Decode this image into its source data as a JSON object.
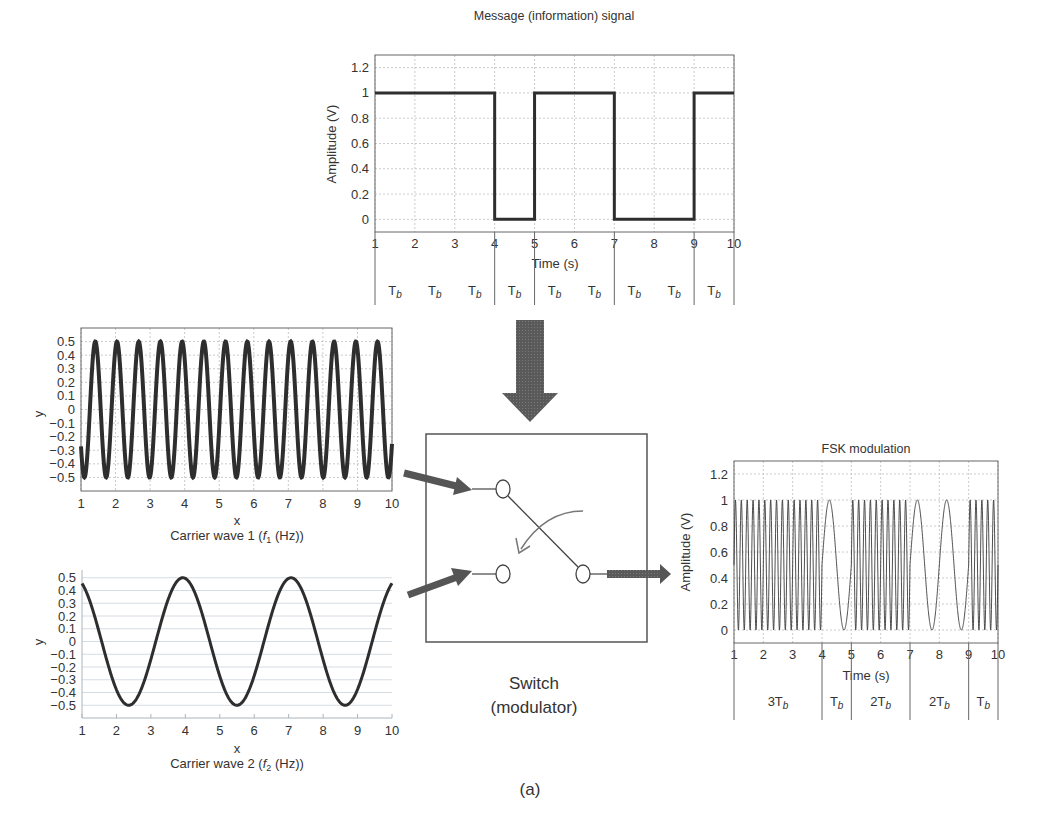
{
  "figure": {
    "caption": "(a)",
    "switch_label_line1": "Switch",
    "switch_label_line2": "(modulator)"
  },
  "chart_data": [
    {
      "id": "message",
      "type": "line",
      "title": "Message (information) signal",
      "xlabel": "Time (s)",
      "ylabel": "Amplitude (V)",
      "xlim": [
        1,
        10
      ],
      "ylim": [
        -0.1,
        1.3
      ],
      "xticks": [
        1,
        2,
        3,
        4,
        5,
        6,
        7,
        8,
        9,
        10
      ],
      "yticks": [
        0,
        0.2,
        0.4,
        0.6,
        0.8,
        1,
        1.2
      ],
      "ytick_labels": [
        "0",
        "0.2",
        "0.4",
        "0.6",
        "0.8",
        "1",
        "1.2"
      ],
      "grid": true,
      "x": [
        1,
        4,
        4,
        5,
        5,
        7,
        7,
        9,
        9,
        10
      ],
      "values": [
        1,
        1,
        0,
        0,
        1,
        1,
        0,
        0,
        1,
        1
      ],
      "bits": [
        1,
        1,
        1,
        0,
        1,
        1,
        0,
        0,
        1
      ],
      "bit_labels": [
        "Tb",
        "Tb",
        "Tb",
        "Tb",
        "Tb",
        "Tb",
        "Tb",
        "Tb",
        "Tb"
      ],
      "bit_dividers": [
        1,
        4,
        5,
        7,
        9,
        10
      ]
    },
    {
      "id": "carrier1",
      "type": "line",
      "title": "Carrier wave 1 (f1 (Hz))",
      "xlabel": "x",
      "ylabel": "y",
      "xlim": [
        1,
        10
      ],
      "ylim": [
        -0.6,
        0.6
      ],
      "xticks": [
        1,
        2,
        3,
        4,
        5,
        6,
        7,
        8,
        9,
        10
      ],
      "yticks": [
        0.5,
        0.4,
        0.3,
        0.2,
        0.1,
        0,
        -0.1,
        -0.2,
        -0.3,
        -0.4,
        -0.5
      ],
      "ytick_labels": [
        "0.5",
        "0.4",
        "0.3",
        "0.2",
        "0.1",
        "0",
        "−0.1",
        "−0.2",
        "−0.3",
        "−0.4",
        "−0.5"
      ],
      "function": "y = 0.5*sin(10x)",
      "amplitude": 0.5,
      "angular_freq": 10,
      "grid": true
    },
    {
      "id": "carrier2",
      "type": "line",
      "title": "Carrier wave 2 (f2 (Hz))",
      "xlabel": "x",
      "ylabel": "y",
      "xlim": [
        1,
        10
      ],
      "ylim": [
        -0.6,
        0.6
      ],
      "xticks": [
        1,
        2,
        3,
        4,
        5,
        6,
        7,
        8,
        9,
        10
      ],
      "yticks": [
        0.5,
        0.4,
        0.3,
        0.2,
        0.1,
        0,
        -0.1,
        -0.2,
        -0.3,
        -0.4,
        -0.5
      ],
      "ytick_labels": [
        "0.5",
        "0.4",
        "0.3",
        "0.2",
        "0.1",
        "0",
        "−0.1",
        "−0.2",
        "−0.3",
        "−0.4",
        "−0.5"
      ],
      "function": "y = 0.5*sin(2x)",
      "amplitude": 0.5,
      "angular_freq": 2,
      "grid": true
    },
    {
      "id": "fsk",
      "type": "line",
      "title": "FSK modulation",
      "xlabel": "Time (s)",
      "ylabel": "Amplitude (V)",
      "xlim": [
        1,
        10
      ],
      "ylim": [
        -0.1,
        1.3
      ],
      "xticks": [
        1,
        2,
        3,
        4,
        5,
        6,
        7,
        8,
        9,
        10
      ],
      "yticks": [
        0,
        0.2,
        0.4,
        0.6,
        0.8,
        1,
        1.2
      ],
      "ytick_labels": [
        "0",
        "0.2",
        "0.4",
        "0.6",
        "0.8",
        "1",
        "1.2"
      ],
      "grid": true,
      "segments": [
        {
          "from": 1,
          "to": 4,
          "freq_hz": 5,
          "label": "3Tb"
        },
        {
          "from": 4,
          "to": 5,
          "freq_hz": 1,
          "label": "Tb"
        },
        {
          "from": 5,
          "to": 7,
          "freq_hz": 5,
          "label": "2Tb"
        },
        {
          "from": 7,
          "to": 9,
          "freq_hz": 1,
          "label": "2Tb"
        },
        {
          "from": 9,
          "to": 10,
          "freq_hz": 5,
          "label": "Tb"
        }
      ],
      "signal": "0.5 + 0.5*sin(2*pi*f*t)"
    }
  ],
  "labels": {
    "msg_title": "Message (information) signal",
    "msg_xlabel": "Time (s)",
    "msg_ylabel": "Amplitude (V)",
    "c1_xlabel": "x",
    "c1_ylabel": "y",
    "c1_caption_pre": "Carrier wave 1 (",
    "c1_caption_f": "f",
    "c1_caption_sub": "1",
    "c1_caption_post": " (Hz))",
    "c2_xlabel": "x",
    "c2_ylabel": "y",
    "c2_caption_pre": "Carrier wave 2 (",
    "c2_caption_f": "f",
    "c2_caption_sub": "2",
    "c2_caption_post": " (Hz))",
    "fsk_title": "FSK modulation",
    "fsk_xlabel": "Time (s)",
    "fsk_ylabel": "Amplitude (V)"
  },
  "colors": {
    "signal": "#2e2e2e",
    "arrow": "#555555",
    "grid": "#bdbdbd",
    "text": "#333333"
  }
}
